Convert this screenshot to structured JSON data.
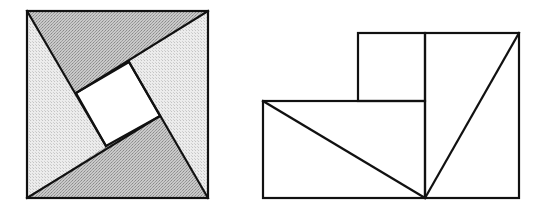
{
  "canvas": {
    "width": 546,
    "height": 209,
    "background": "#ffffff"
  },
  "colors": {
    "stroke": "#111111",
    "dark_fill": "#b9b9b9",
    "light_fill": "#e4e4e4",
    "white_fill": "#ffffff"
  },
  "figures": [
    {
      "id": "pinwheel-square",
      "description": "Large square divided into four congruent right triangles arranged around a central white square",
      "outer_square": {
        "x": 27,
        "y": 11,
        "width": 181,
        "height": 187
      },
      "inner_square": [
        [
          76,
          93
        ],
        [
          129,
          62
        ],
        [
          160,
          116
        ],
        [
          106,
          146
        ]
      ],
      "triangles": [
        {
          "name": "top-triangle",
          "tone": "dark",
          "points": [
            [
              27,
              11
            ],
            [
              208,
              11
            ],
            [
              129,
              62
            ],
            [
              76,
              93
            ]
          ]
        },
        {
          "name": "right-triangle",
          "tone": "light",
          "points": [
            [
              208,
              11
            ],
            [
              208,
              198
            ],
            [
              160,
              116
            ],
            [
              129,
              62
            ]
          ]
        },
        {
          "name": "bottom-triangle",
          "tone": "dark",
          "points": [
            [
              208,
              198
            ],
            [
              27,
              198
            ],
            [
              106,
              146
            ],
            [
              160,
              116
            ]
          ]
        },
        {
          "name": "left-triangle",
          "tone": "light",
          "points": [
            [
              27,
              198
            ],
            [
              27,
              11
            ],
            [
              76,
              93
            ],
            [
              106,
              146
            ]
          ]
        }
      ]
    },
    {
      "id": "rearranged-figure",
      "description": "Same pieces rearranged: small white square on top of a dark rectangle (two dark triangles) beside a tall light rectangle (two light triangles)",
      "white_square": {
        "x": 358,
        "y": 33,
        "width": 67,
        "height": 68
      },
      "dark_rectangle": {
        "x": 263,
        "y": 101,
        "width": 162,
        "height": 97
      },
      "light_rectangle": {
        "x": 425,
        "y": 33,
        "width": 94,
        "height": 165
      },
      "diagonals": [
        {
          "name": "dark-rect-diagonal",
          "from": [
            263,
            101
          ],
          "to": [
            425,
            198
          ]
        },
        {
          "name": "light-rect-diagonal",
          "from": [
            519,
            33
          ],
          "to": [
            425,
            198
          ]
        }
      ]
    }
  ]
}
